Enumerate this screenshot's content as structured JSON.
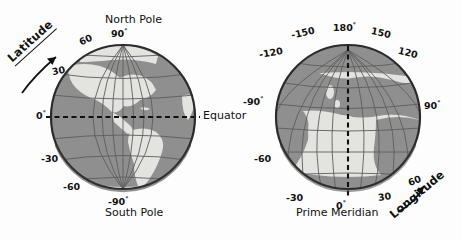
{
  "figure": {
    "title_alt": "Latitude and Longitude globes",
    "background": "#fdfdfd",
    "colors": {
      "ocean": "#8f8f8f",
      "land": "#e3e3e0",
      "graticule": "#5d5d5d",
      "outline": "#2b2b2b",
      "dashed": "#111111",
      "text": "#111111"
    }
  },
  "globes": [
    {
      "id": "latitude-globe",
      "name": "Latitude globe (Americas)",
      "cx": 123,
      "cy": 117,
      "r": 73,
      "axis_word": "Latitude",
      "pole_top": "North Pole",
      "pole_bottom": "South Pole",
      "equator_label": "Equator",
      "ticks": [
        {
          "text": "90",
          "deg": "°",
          "x": 111,
          "y": 30
        },
        {
          "text": "60",
          "deg": "",
          "x": 79,
          "y": 40
        },
        {
          "text": "30",
          "deg": "",
          "x": 54,
          "y": 69
        },
        {
          "text": "0",
          "deg": "°",
          "x": 38,
          "y": 114
        },
        {
          "text": "-30",
          "deg": "",
          "x": 46,
          "y": 158
        },
        {
          "text": "-60",
          "deg": "",
          "x": 68,
          "y": 186
        },
        {
          "text": "-90",
          "deg": "°",
          "x": 111,
          "y": 200
        }
      ]
    },
    {
      "id": "longitude-globe",
      "name": "Longitude globe (Africa / Europe)",
      "cx": 348,
      "cy": 117,
      "r": 73,
      "axis_word": "Longitude",
      "meridian_label": "Prime Meridian",
      "ticks": [
        {
          "text": "180",
          "deg": "°",
          "x": 336,
          "y": 27
        },
        {
          "text": "-150",
          "deg": "",
          "x": 294,
          "y": 32
        },
        {
          "text": "150",
          "deg": "",
          "x": 372,
          "y": 32
        },
        {
          "text": "-120",
          "deg": "",
          "x": 263,
          "y": 53
        },
        {
          "text": "120",
          "deg": "",
          "x": 400,
          "y": 53
        },
        {
          "text": "-90",
          "deg": "°",
          "x": 245,
          "y": 100
        },
        {
          "text": "90",
          "deg": "°",
          "x": 426,
          "y": 103
        },
        {
          "text": "-60",
          "deg": "",
          "x": 258,
          "y": 158
        },
        {
          "text": "60",
          "deg": "",
          "x": 412,
          "y": 180
        },
        {
          "text": "-30",
          "deg": "",
          "x": 290,
          "y": 196
        },
        {
          "text": "30",
          "deg": "",
          "x": 381,
          "y": 196
        },
        {
          "text": "0",
          "deg": "°",
          "x": 338,
          "y": 205
        }
      ]
    }
  ]
}
